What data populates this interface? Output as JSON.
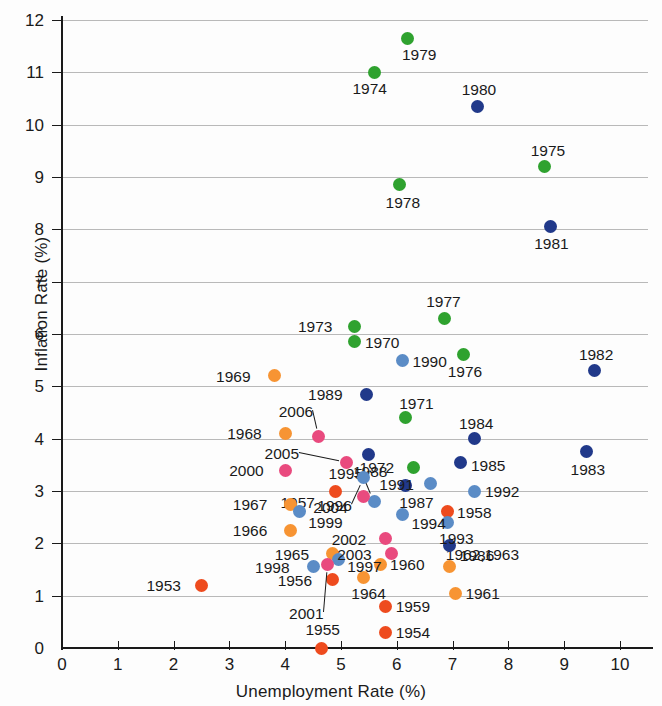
{
  "chart_data": {
    "type": "scatter",
    "title": "",
    "xlabel": "Unemployment Rate (%)",
    "ylabel": "Inflation Rate (%)",
    "xlim": [
      0,
      10.6
    ],
    "ylim": [
      0,
      12.2
    ],
    "xticks": [
      0,
      1,
      2,
      3,
      4,
      5,
      6,
      7,
      8,
      9,
      10
    ],
    "yticks": [
      0,
      1,
      2,
      3,
      4,
      5,
      6,
      7,
      8,
      9,
      10,
      11,
      12
    ],
    "grid": "horizontal",
    "legend": "none",
    "colors": {
      "1950s": "#EE4B1E",
      "1960s": "#F79433",
      "1970s": "#2FA22F",
      "1980s": "#21398A",
      "1990s": "#5B8CC6",
      "2000s": "#E94A7E",
      "axis": "#1a1a1a",
      "gridline": "#b9b9b9",
      "background": "#fdfdfd"
    },
    "points": [
      {
        "year": "1953",
        "x": 2.5,
        "y": 1.2,
        "color": "#EE4B1E",
        "lx": -55,
        "ly": -7,
        "leader": false
      },
      {
        "year": "1954",
        "x": 5.8,
        "y": 0.3,
        "color": "#EE4B1E",
        "lx": 10,
        "ly": -7,
        "leader": false
      },
      {
        "year": "1955",
        "x": 4.65,
        "y": 0.0,
        "color": "#EE4B1E",
        "lx": -16,
        "ly": -26,
        "leader": false
      },
      {
        "year": "1956",
        "x": 4.85,
        "y": 1.3,
        "color": "#EE4B1E",
        "lx": -55,
        "ly": -7,
        "leader": false
      },
      {
        "year": "1957",
        "x": 4.9,
        "y": 3.0,
        "color": "#EE4B1E",
        "lx": -55,
        "ly": 4,
        "leader": false
      },
      {
        "year": "1958",
        "x": 6.9,
        "y": 2.6,
        "color": "#EE4B1E",
        "lx": 10,
        "ly": -7,
        "leader": false
      },
      {
        "year": "1959",
        "x": 5.8,
        "y": 0.8,
        "color": "#EE4B1E",
        "lx": 10,
        "ly": -7,
        "leader": false
      },
      {
        "year": "1960",
        "x": 5.7,
        "y": 1.6,
        "color": "#F79433",
        "lx": 10,
        "ly": -7,
        "leader": false
      },
      {
        "year": "1961",
        "x": 7.05,
        "y": 1.05,
        "color": "#F79433",
        "lx": 10,
        "ly": -7,
        "leader": false
      },
      {
        "year": "1962,1963",
        "x": 6.95,
        "y": 1.55,
        "color": "#F79433",
        "lx": -4,
        "ly": -20,
        "leader": false
      },
      {
        "year": "1964",
        "x": 5.4,
        "y": 1.35,
        "color": "#F79433",
        "lx": -12,
        "ly": 9,
        "leader": false
      },
      {
        "year": "1965",
        "x": 4.85,
        "y": 1.8,
        "color": "#F79433",
        "lx": -58,
        "ly": -7,
        "leader": false
      },
      {
        "year": "1966",
        "x": 4.1,
        "y": 2.25,
        "color": "#F79433",
        "lx": -58,
        "ly": -7,
        "leader": false
      },
      {
        "year": "1967",
        "x": 4.1,
        "y": 2.75,
        "color": "#F79433",
        "lx": -58,
        "ly": -7,
        "leader": false
      },
      {
        "year": "1968",
        "x": 4.0,
        "y": 4.1,
        "color": "#F79433",
        "lx": -58,
        "ly": -7,
        "leader": false
      },
      {
        "year": "1969",
        "x": 3.8,
        "y": 5.2,
        "color": "#F79433",
        "lx": -58,
        "ly": -7,
        "leader": false
      },
      {
        "year": "1970",
        "x": 5.25,
        "y": 5.85,
        "color": "#2FA22F",
        "lx": 10,
        "ly": -7,
        "leader": false
      },
      {
        "year": "1971",
        "x": 6.15,
        "y": 4.4,
        "color": "#2FA22F",
        "lx": -6,
        "ly": -22,
        "leader": false
      },
      {
        "year": "1972",
        "x": 6.3,
        "y": 3.45,
        "color": "#2FA22F",
        "lx": -54,
        "ly": -7,
        "leader": false
      },
      {
        "year": "1973",
        "x": 5.25,
        "y": 6.15,
        "color": "#2FA22F",
        "lx": -57,
        "ly": -7,
        "leader": false
      },
      {
        "year": "1974",
        "x": 5.6,
        "y": 11.0,
        "color": "#2FA22F",
        "lx": -22,
        "ly": 9,
        "leader": false
      },
      {
        "year": "1975",
        "x": 8.65,
        "y": 9.2,
        "color": "#2FA22F",
        "lx": -14,
        "ly": -24,
        "leader": false
      },
      {
        "year": "1976",
        "x": 7.2,
        "y": 5.6,
        "color": "#2FA22F",
        "lx": -16,
        "ly": 9,
        "leader": false
      },
      {
        "year": "1977",
        "x": 6.85,
        "y": 6.3,
        "color": "#2FA22F",
        "lx": -18,
        "ly": -24,
        "leader": false
      },
      {
        "year": "1978",
        "x": 6.05,
        "y": 8.85,
        "color": "#2FA22F",
        "lx": -14,
        "ly": 10,
        "leader": false
      },
      {
        "year": "1979",
        "x": 6.2,
        "y": 11.65,
        "color": "#2FA22F",
        "lx": -6,
        "ly": 9,
        "leader": false
      },
      {
        "year": "1980",
        "x": 7.45,
        "y": 10.35,
        "color": "#21398A",
        "lx": -16,
        "ly": -24,
        "leader": false
      },
      {
        "year": "1981",
        "x": 8.75,
        "y": 8.05,
        "color": "#21398A",
        "lx": -16,
        "ly": 9,
        "leader": false
      },
      {
        "year": "1982",
        "x": 9.55,
        "y": 5.3,
        "color": "#21398A",
        "lx": -16,
        "ly": -24,
        "leader": false
      },
      {
        "year": "1983",
        "x": 9.4,
        "y": 3.75,
        "color": "#21398A",
        "lx": -16,
        "ly": 10,
        "leader": false
      },
      {
        "year": "1984",
        "x": 7.4,
        "y": 4.0,
        "color": "#21398A",
        "lx": -16,
        "ly": -23,
        "leader": false
      },
      {
        "year": "1985",
        "x": 7.15,
        "y": 3.55,
        "color": "#21398A",
        "lx": 10,
        "ly": -4,
        "leader": false
      },
      {
        "year": "1986",
        "x": 6.95,
        "y": 1.95,
        "color": "#21398A",
        "lx": 10,
        "ly": 2,
        "leader": false
      },
      {
        "year": "1987",
        "x": 6.15,
        "y": 3.1,
        "color": "#21398A",
        "lx": -6,
        "ly": 9,
        "leader": false
      },
      {
        "year": "1988",
        "x": 5.5,
        "y": 3.7,
        "color": "#21398A",
        "lx": -16,
        "ly": 10,
        "leader": false
      },
      {
        "year": "1989",
        "x": 5.45,
        "y": 4.85,
        "color": "#21398A",
        "lx": -58,
        "ly": -7,
        "leader": false
      },
      {
        "year": "1990",
        "x": 6.1,
        "y": 5.5,
        "color": "#5B8CC6",
        "lx": 10,
        "ly": -6,
        "leader": false
      },
      {
        "year": "1991",
        "x": 6.6,
        "y": 3.15,
        "color": "#5B8CC6",
        "lx": -51,
        "ly": -6,
        "leader": false
      },
      {
        "year": "1992",
        "x": 7.4,
        "y": 3.0,
        "color": "#5B8CC6",
        "lx": 10,
        "ly": -7,
        "leader": false
      },
      {
        "year": "1993",
        "x": 6.9,
        "y": 2.4,
        "color": "#5B8CC6",
        "lx": -8,
        "ly": 9,
        "leader": false
      },
      {
        "year": "1994",
        "x": 6.1,
        "y": 2.55,
        "color": "#5B8CC6",
        "lx": 9,
        "ly": 1,
        "leader": false
      },
      {
        "year": "1995",
        "x": 5.6,
        "y": 2.8,
        "color": "#5B8CC6",
        "lx": -46,
        "ly": -35,
        "leader": true
      },
      {
        "year": "1996",
        "x": 5.4,
        "y": 3.25,
        "color": "#5B8CC6",
        "lx": -46,
        "ly": 20,
        "leader": true
      },
      {
        "year": "1997",
        "x": 4.95,
        "y": 1.7,
        "color": "#5B8CC6",
        "lx": 9,
        "ly": 0,
        "leader": false
      },
      {
        "year": "1998",
        "x": 4.5,
        "y": 1.55,
        "color": "#5B8CC6",
        "lx": -58,
        "ly": -7,
        "leader": false
      },
      {
        "year": "1999",
        "x": 4.25,
        "y": 2.6,
        "color": "#5B8CC6",
        "lx": 9,
        "ly": 3,
        "leader": false
      },
      {
        "year": "2000",
        "x": 4.0,
        "y": 3.4,
        "color": "#E94A7E",
        "lx": -56,
        "ly": -7,
        "leader": false
      },
      {
        "year": "2001",
        "x": 4.75,
        "y": 1.6,
        "color": "#E94A7E",
        "lx": -38,
        "ly": 42,
        "leader": true
      },
      {
        "year": "2002",
        "x": 5.8,
        "y": 2.1,
        "color": "#E94A7E",
        "lx": -54,
        "ly": -6,
        "leader": false
      },
      {
        "year": "2003",
        "x": 5.9,
        "y": 1.8,
        "color": "#E94A7E",
        "lx": -54,
        "ly": -7,
        "leader": false
      },
      {
        "year": "2004",
        "x": 5.4,
        "y": 2.9,
        "color": "#E94A7E",
        "lx": -50,
        "ly": 4,
        "leader": false
      },
      {
        "year": "2005",
        "x": 5.1,
        "y": 3.55,
        "color": "#E94A7E",
        "lx": -82,
        "ly": -16,
        "leader": true
      },
      {
        "year": "2006",
        "x": 4.6,
        "y": 4.05,
        "color": "#E94A7E",
        "lx": -40,
        "ly": -32,
        "leader": true
      }
    ]
  }
}
